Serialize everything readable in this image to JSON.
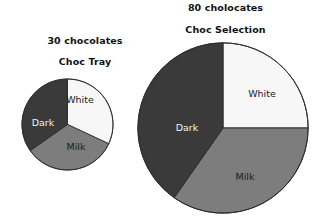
{
  "chart_data": [
    {
      "type": "pie",
      "id": "choc-tray",
      "title": "Choc Tray",
      "supertitle": "30 chocolates",
      "total": 30,
      "total_unit": "chocolates",
      "categories": [
        "White",
        "Milk",
        "Dark"
      ],
      "values": [
        9.6,
        10.0,
        10.4
      ],
      "angles_deg": [
        115,
        120,
        125
      ],
      "start_angle_deg": 0,
      "direction": "clockwise",
      "slice_colors": [
        "#f7f7f7",
        "#7d7d7d",
        "#3a3a3a"
      ],
      "slice_label_colors": [
        "#1b1b1b",
        "#1b1b1b",
        "#f2f2f2"
      ],
      "labels_inside": true,
      "legend": "none",
      "grid": false,
      "radius_px": 46
    },
    {
      "type": "pie",
      "id": "choc-selection",
      "title": "Choc Selection",
      "supertitle": "80 cholocates",
      "total": 80,
      "total_unit": "cholocates",
      "categories": [
        "White",
        "Milk",
        "Dark"
      ],
      "values": [
        20,
        27.8,
        32.2
      ],
      "angles_deg": [
        90,
        125,
        145
      ],
      "start_angle_deg": 0,
      "direction": "clockwise",
      "slice_colors": [
        "#f7f7f7",
        "#7d7d7d",
        "#3a3a3a"
      ],
      "slice_label_colors": [
        "#1b1b1b",
        "#1b1b1b",
        "#f2f2f2"
      ],
      "labels_inside": true,
      "legend": "none",
      "grid": false,
      "radius_px": 85
    }
  ],
  "left_chart": {
    "count_title": "30 chocolates",
    "name_title": "Choc Tray",
    "slices": {
      "white_label": "White",
      "milk_label": "Milk",
      "dark_label": "Dark"
    }
  },
  "right_chart": {
    "count_title": "80 cholocates",
    "name_title": "Choc Selection",
    "slices": {
      "white_label": "White",
      "milk_label": "Milk",
      "dark_label": "Dark"
    }
  },
  "style": {
    "dark_color": "#3a3a3a",
    "milk_color": "#7d7d7d",
    "white_color": "#f7f7f7",
    "outline_color": "#2b2b2b",
    "background": "#ffffff",
    "text_color": "#141414"
  }
}
